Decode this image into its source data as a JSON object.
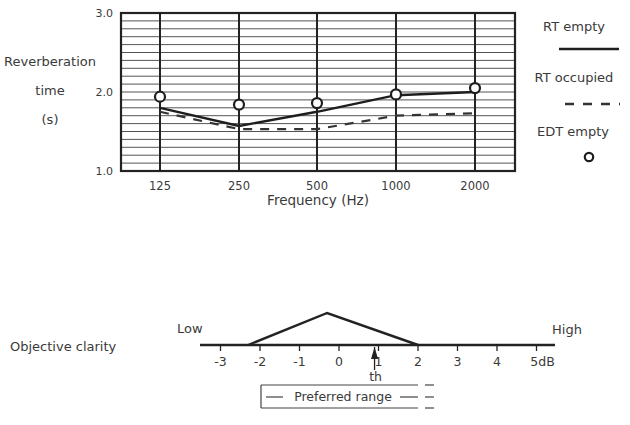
{
  "chart_data": [
    {
      "type": "line",
      "title": "",
      "xlabel": "Frequency (Hz)",
      "ylabel": "Reverberation time (s)",
      "ylabel_lines": [
        "Reverberation",
        "time",
        "(s)"
      ],
      "categories": [
        "125",
        "250",
        "500",
        "1000",
        "2000"
      ],
      "ylim": [
        1.0,
        3.0
      ],
      "yticks": [
        "1.0",
        "2.0",
        "3.0"
      ],
      "grid": true,
      "grid_minor_step": 0.1,
      "legend_position": "right",
      "series": [
        {
          "name": "RT empty",
          "style": "solid",
          "values": [
            1.8,
            1.57,
            1.75,
            1.96,
            2.0
          ]
        },
        {
          "name": "RT occupied",
          "style": "dashed",
          "values": [
            1.75,
            1.53,
            1.53,
            1.7,
            1.73
          ]
        },
        {
          "name": "EDT empty",
          "style": "circle-marker",
          "values": [
            1.94,
            1.84,
            1.86,
            1.97,
            2.05
          ]
        }
      ]
    },
    {
      "type": "diagram",
      "title": "Objective clarity",
      "xlim": [
        -3.5,
        5.5
      ],
      "xticks": [
        "-3",
        "-2",
        "-1",
        "0",
        "1",
        "2",
        "3",
        "4",
        "5dB"
      ],
      "xtick_values": [
        -3,
        -2,
        -1,
        0,
        1,
        2,
        3,
        4,
        5
      ],
      "unit": "dB",
      "left_label": "Low",
      "right_label": "High",
      "triangle": {
        "left": -2.3,
        "apex": -0.3,
        "right": 2.0
      },
      "threshold": {
        "label": "th",
        "value": 0.9
      },
      "preferred_range": {
        "label": "Preferred range",
        "from": -2.0,
        "to": 2.0,
        "open_ended_right": true
      }
    }
  ]
}
